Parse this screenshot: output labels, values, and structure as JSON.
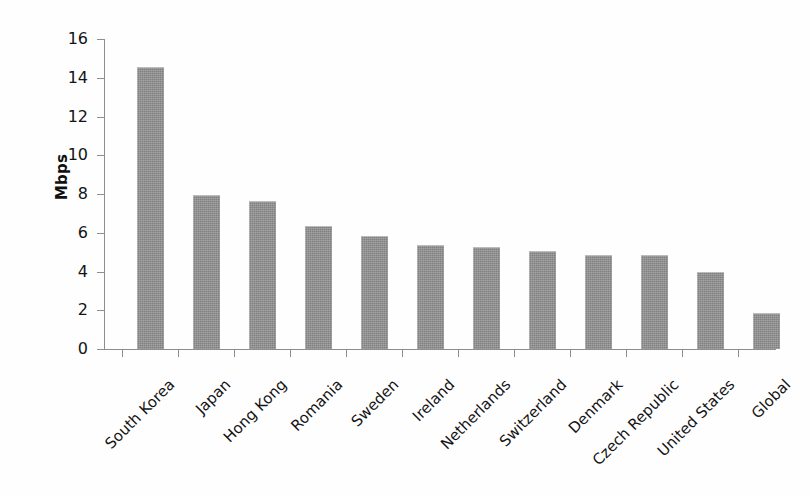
{
  "chart_data": {
    "type": "bar",
    "title": "",
    "subtitle": "",
    "xlabel": "",
    "ylabel": "Mbps",
    "ylim": [
      0,
      16
    ],
    "grid": false,
    "legend": "none",
    "orientation": "vertical",
    "bar_color": "#8e8e8e",
    "axis_color": "#8d8d8d",
    "text_color": "#141414",
    "background_color": "#ffffff",
    "categories": [
      "South Korea",
      "Japan",
      "Hong Kong",
      "Romania",
      "Sweden",
      "Ireland",
      "Netherlands",
      "Switzerland",
      "Denmark",
      "Czech Republic",
      "United States",
      "Global"
    ],
    "values": [
      14.5,
      7.9,
      7.6,
      6.3,
      5.8,
      5.3,
      5.2,
      5.0,
      4.8,
      4.8,
      3.9,
      1.8
    ],
    "ytick_labels": [
      "0",
      "2",
      "4",
      "6",
      "8",
      "10",
      "12",
      "14",
      "16"
    ],
    "ytick_values": [
      0,
      2,
      4,
      6,
      8,
      10,
      12,
      14,
      16
    ],
    "xtick_label_rotation": -45,
    "units": "Mbps"
  }
}
